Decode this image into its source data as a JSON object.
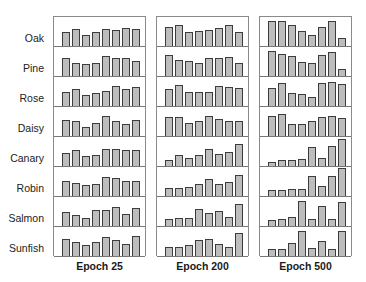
{
  "chart_data": {
    "type": "bar",
    "title": "",
    "layout": "small multiples: 8 rows (items) x 3 columns (epochs), each cell an 8-bar histogram",
    "rows": [
      "Oak",
      "Pine",
      "Rose",
      "Daisy",
      "Canary",
      "Robin",
      "Salmon",
      "Sunfish"
    ],
    "columns": [
      "Epoch 25",
      "Epoch 200",
      "Epoch 500"
    ],
    "bars_per_cell": 8,
    "value_unit": "relative bar height (px, cell height 30)",
    "grid": false,
    "values": {
      "Epoch 25": {
        "Oak": [
          14,
          17,
          11,
          14,
          17,
          16,
          18,
          17
        ],
        "Pine": [
          18,
          13,
          12,
          13,
          20,
          18,
          18,
          15
        ],
        "Rose": [
          14,
          17,
          11,
          13,
          15,
          20,
          17,
          19
        ],
        "Daisy": [
          16,
          15,
          9,
          13,
          20,
          15,
          12,
          16
        ],
        "Canary": [
          13,
          16,
          10,
          11,
          17,
          17,
          16,
          16
        ],
        "Robin": [
          15,
          13,
          11,
          12,
          19,
          18,
          15,
          15
        ],
        "Salmon": [
          14,
          11,
          8,
          16,
          16,
          19,
          12,
          18
        ],
        "Sunfish": [
          17,
          14,
          11,
          14,
          19,
          16,
          12,
          20
        ]
      },
      "Epoch 200": {
        "Oak": [
          19,
          21,
          14,
          15,
          16,
          18,
          21,
          14
        ],
        "Pine": [
          21,
          16,
          15,
          13,
          18,
          18,
          19,
          13
        ],
        "Rose": [
          17,
          21,
          14,
          14,
          14,
          20,
          19,
          18
        ],
        "Daisy": [
          19,
          19,
          13,
          15,
          20,
          17,
          15,
          15
        ],
        "Canary": [
          6,
          11,
          8,
          11,
          17,
          12,
          14,
          22
        ],
        "Robin": [
          8,
          8,
          9,
          12,
          17,
          12,
          14,
          21
        ],
        "Salmon": [
          7,
          8,
          8,
          17,
          13,
          15,
          9,
          22
        ],
        "Sunfish": [
          9,
          9,
          11,
          16,
          17,
          12,
          9,
          23
        ]
      },
      "Epoch 500": {
        "Oak": [
          25,
          25,
          21,
          15,
          11,
          19,
          25,
          8
        ],
        "Pine": [
          25,
          22,
          20,
          14,
          13,
          21,
          24,
          7
        ],
        "Rose": [
          18,
          23,
          13,
          12,
          9,
          23,
          24,
          22
        ],
        "Daisy": [
          20,
          22,
          12,
          12,
          15,
          19,
          20,
          18
        ],
        "Canary": [
          4,
          6,
          6,
          7,
          19,
          8,
          20,
          27
        ],
        "Robin": [
          6,
          6,
          7,
          7,
          20,
          10,
          20,
          28
        ],
        "Salmon": [
          6,
          7,
          9,
          25,
          7,
          20,
          7,
          24
        ],
        "Sunfish": [
          7,
          7,
          13,
          25,
          8,
          15,
          7,
          25
        ]
      }
    },
    "colors": {
      "bar_fill": "#bdbdbd",
      "bar_edge": "#3c3c3c",
      "frame": "#8a8a8a"
    }
  }
}
